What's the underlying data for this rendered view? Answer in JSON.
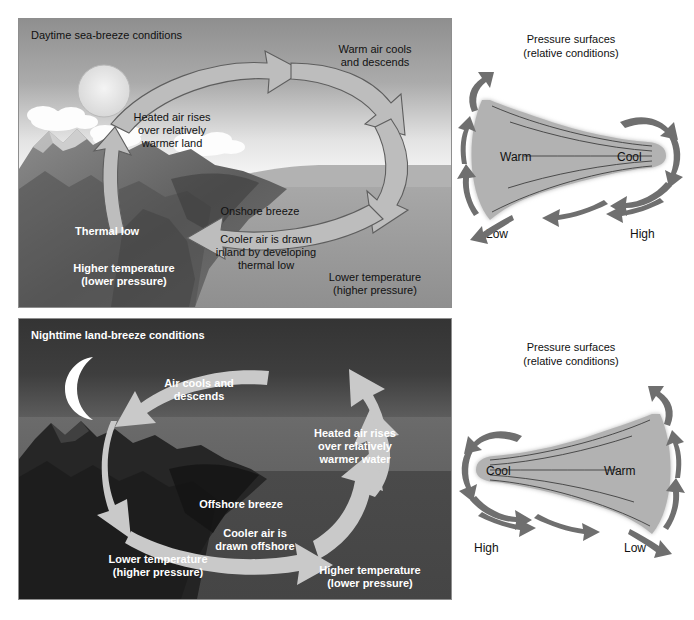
{
  "figure": {
    "type": "diagram",
    "panels": [
      {
        "id": "daytime",
        "title": "Daytime sea-breeze conditions",
        "title_color": "#111111",
        "labels": {
          "rises": "Heated air rises\nover relatively\nwarmer land",
          "rises_l1": "Heated air rises",
          "rises_l2": "over relatively",
          "rises_l3": "warmer land",
          "cools_l1": "Warm air cools",
          "cools_l2": "and descends",
          "breeze": "Onshore breeze",
          "drawn_l1": "Cooler air is drawn",
          "drawn_l2": "inland by developing",
          "drawn_l3": "thermal low",
          "thermal_low": "Thermal low",
          "land_temp_l1": "Higher temperature",
          "land_temp_l2": "(lower pressure)",
          "sea_temp_l1": "Lower temperature",
          "sea_temp_l2": "(higher pressure)"
        }
      },
      {
        "id": "nighttime",
        "title": "Nighttime land-breeze conditions",
        "title_color": "#ffffff",
        "labels": {
          "cools_l1": "Air cools and",
          "cools_l2": "descends",
          "rises_l1": "Heated air rises",
          "rises_l2": "over relatively",
          "rises_l3": "warmer water",
          "breeze": "Offshore breeze",
          "drawn_l1": "Cooler air is",
          "drawn_l2": "drawn offshore",
          "land_temp_l1": "Lower temperature",
          "land_temp_l2": "(higher pressure)",
          "sea_temp_l1": "Higher temperature",
          "sea_temp_l2": "(lower pressure)"
        }
      }
    ],
    "pressure_diagrams": [
      {
        "id": "pressure-day",
        "title_l1": "Pressure surfaces",
        "title_l2": "(relative conditions)",
        "left_temp": "Warm",
        "right_temp": "Cool",
        "left_pressure": "Low",
        "right_pressure": "High",
        "wide_end": "left",
        "surface_fill": "#b4b4b4",
        "arrow_color": "#6e6e6e"
      },
      {
        "id": "pressure-night",
        "title_l1": "Pressure surfaces",
        "title_l2": "(relative conditions)",
        "left_temp": "Cool",
        "right_temp": "Warm",
        "left_pressure": "High",
        "right_pressure": "Low",
        "wide_end": "right",
        "surface_fill": "#b4b4b4",
        "arrow_color": "#6e6e6e"
      }
    ],
    "colors": {
      "day_sky_top": "#9a9a9a",
      "day_sky_horizon": "#f2f2f2",
      "day_water": "#9d9d9d",
      "night_sky_top": "#3f3f3f",
      "night_sky_band": "#6a6a6a",
      "night_water": "#4c4c4c",
      "day_arrow": "#b9b9b9",
      "night_arrow": "#c9c9c9",
      "cloud": "#ffffff",
      "sun": "#e8e8e8",
      "moon": "#ffffff",
      "land_day": "#6d6d6d",
      "land_night": "#2a2a2a"
    },
    "icons": {
      "sun": "sun-icon",
      "moon": "crescent-moon-icon",
      "cloud": "cloud-icon",
      "mountain": "mountain-icon",
      "arrow": "circulation-arrow-icon"
    }
  }
}
